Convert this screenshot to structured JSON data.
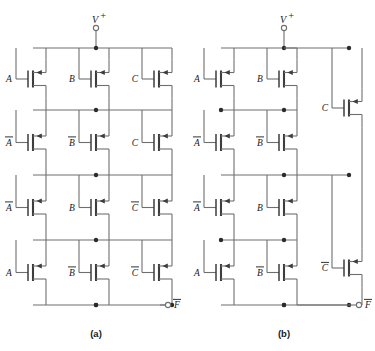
{
  "figure": {
    "background": "#ffffff",
    "wire_color": "#6f6f6f",
    "device_color": "#3d3d3d",
    "node_color": "#2b2b2b",
    "supply_label": "V",
    "supply_superscript": "+",
    "output_label": "F",
    "output_overbar": true
  },
  "panels": [
    {
      "id": "a",
      "caption": "(a)",
      "origin_x": 0,
      "supply_x": 96,
      "rails": [
        48,
        110,
        175,
        240,
        305
      ],
      "columns": [
        33,
        96,
        159
      ],
      "rows": [
        {
          "labels": [
            "A",
            "B",
            "C"
          ],
          "overbars": [
            false,
            false,
            false
          ]
        },
        {
          "labels": [
            "A",
            "B",
            "C"
          ],
          "overbars": [
            true,
            true,
            false
          ]
        },
        {
          "labels": [
            "A",
            "B",
            "C"
          ],
          "overbars": [
            true,
            false,
            true
          ]
        },
        {
          "labels": [
            "A",
            "B",
            "C"
          ],
          "overbars": [
            false,
            true,
            true
          ]
        }
      ]
    },
    {
      "id": "b",
      "caption": "(b)",
      "origin_x": 188,
      "supply_x": 284,
      "rails": [
        48,
        110,
        175,
        240,
        305
      ],
      "columns": [
        221,
        284
      ],
      "side_column_x": 349,
      "rows": [
        {
          "labels": [
            "A",
            "B"
          ],
          "overbars": [
            false,
            false
          ]
        },
        {
          "labels": [
            "A",
            "B"
          ],
          "overbars": [
            true,
            true
          ]
        },
        {
          "labels": [
            "A",
            "B"
          ],
          "overbars": [
            true,
            false
          ]
        },
        {
          "labels": [
            "A",
            "B"
          ],
          "overbars": [
            false,
            true
          ]
        }
      ],
      "side_devices": [
        {
          "label": "C",
          "overbar": false,
          "y": 108
        },
        {
          "label": "C",
          "overbar": true,
          "y": 268
        }
      ]
    }
  ]
}
